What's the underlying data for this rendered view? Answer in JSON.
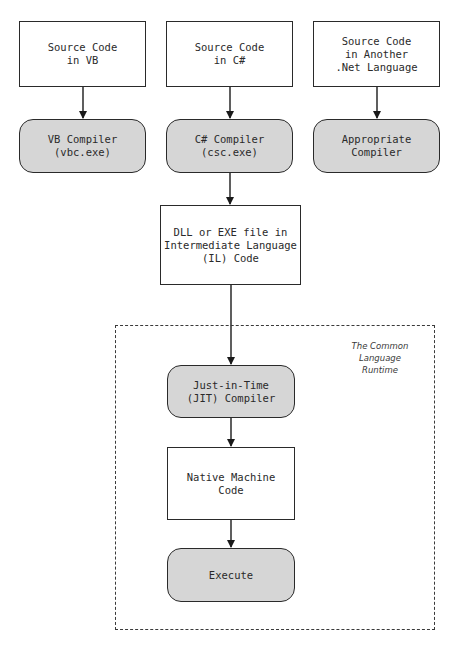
{
  "diagram": {
    "sources": [
      {
        "label": "Source Code\nin VB"
      },
      {
        "label": "Source Code\nin C#"
      },
      {
        "label": "Source Code\nin Another\n.Net Language"
      }
    ],
    "compilers": [
      {
        "label": "VB Compiler\n(vbc.exe)"
      },
      {
        "label": "C# Compiler\n(csc.exe)"
      },
      {
        "label": "Appropriate\nCompiler"
      }
    ],
    "il_output": {
      "label": "DLL or EXE file in\nIntermediate Language\n(IL) Code"
    },
    "clr": {
      "label": "The Common\nLanguage\nRuntime",
      "jit": {
        "label": "Just-in-Time\n(JIT) Compiler"
      },
      "native": {
        "label": "Native Machine\nCode"
      },
      "execute": {
        "label": "Execute"
      }
    }
  }
}
